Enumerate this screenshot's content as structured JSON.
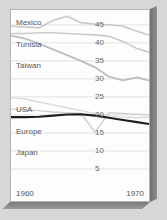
{
  "chart_data": {
    "type": "line",
    "title": "",
    "subtitle": "",
    "xlabel": "",
    "ylabel": "",
    "xlim": [
      1960,
      1970
    ],
    "ylim": [
      0,
      48
    ],
    "grid": true,
    "legend_position": "inline-left",
    "x_tick_labels": [
      "1960",
      "1970"
    ],
    "y_tick_labels": [
      "5",
      "10",
      "15",
      "20",
      "25",
      "30",
      "35",
      "40",
      "45"
    ],
    "y_ticks": [
      5,
      10,
      15,
      20,
      25,
      30,
      35,
      40,
      45
    ],
    "x": [
      1960,
      1961,
      1962,
      1963,
      1964,
      1965,
      1966,
      1967,
      1968,
      1969,
      1970
    ],
    "series": [
      {
        "name": "Mexico",
        "color": "#c9c9c9",
        "width": 1.6,
        "values": [
          44.6,
          44.4,
          44.2,
          46.2,
          47.4,
          45.6,
          45.2,
          45.0,
          44.6,
          43.2,
          42.0
        ]
      },
      {
        "name": "Tunisia",
        "color": "#cacaca",
        "width": 1.6,
        "values": [
          42.6,
          42.6,
          42.8,
          42.8,
          42.6,
          42.4,
          42.2,
          41.8,
          40.4,
          38.4,
          37.2
        ]
      },
      {
        "name": "Taiwan",
        "color": "#bdbdbd",
        "width": 1.8,
        "values": [
          42.0,
          41.2,
          39.8,
          38.2,
          36.6,
          35.0,
          33.2,
          30.6,
          29.6,
          30.4,
          29.4
        ]
      },
      {
        "name": "USA",
        "color": "#dadada",
        "width": 1.4,
        "values": [
          24.8,
          24.4,
          23.6,
          22.8,
          22.0,
          21.2,
          20.4,
          19.8,
          19.4,
          19.2,
          19.4
        ]
      },
      {
        "name": "Europe",
        "color": "#d2d2d2",
        "width": 1.4,
        "values": [
          21.6,
          21.4,
          21.2,
          20.8,
          20.6,
          20.4,
          15.2,
          20.6,
          20.4,
          20.2,
          20.0
        ]
      },
      {
        "name": "Japan",
        "color": "#1d1d1d",
        "width": 2.1,
        "values": [
          19.4,
          19.4,
          19.5,
          19.8,
          20.1,
          20.2,
          19.8,
          19.2,
          18.6,
          18.0,
          17.4
        ]
      }
    ],
    "series_labels": [
      {
        "name": "Mexico",
        "x_px": 5,
        "y_px": 8
      },
      {
        "name": "Tunisia",
        "x_px": 5,
        "y_px": 30
      },
      {
        "name": "Taiwan",
        "x_px": 5,
        "y_px": 51
      },
      {
        "name": "USA",
        "x_px": 5,
        "y_px": 95
      },
      {
        "name": "Europe",
        "x_px": 5,
        "y_px": 117
      },
      {
        "name": "Japan",
        "x_px": 5,
        "y_px": 138
      }
    ]
  }
}
